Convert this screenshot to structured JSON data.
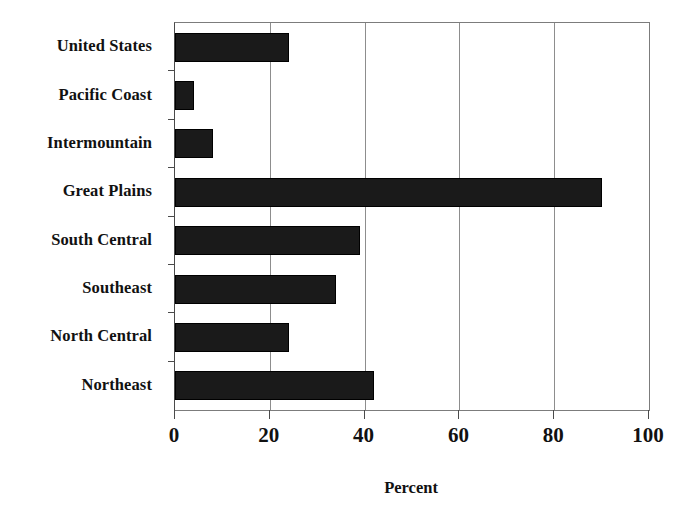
{
  "chart_data": {
    "type": "bar",
    "orientation": "horizontal",
    "title": "",
    "subtitle": "",
    "xlabel": "Percent",
    "ylabel": "",
    "xlim": [
      0,
      100
    ],
    "xticks": [
      0,
      20,
      40,
      60,
      80,
      100
    ],
    "xtick_labels": [
      "0",
      "20",
      "40",
      "60",
      "80",
      "100"
    ],
    "grid": "vertical",
    "legend": "none",
    "bar_color": "#1a1a1a",
    "categories": [
      "United States",
      "Pacific Coast",
      "Intermountain",
      "Great Plains",
      "South Central",
      "Southeast",
      "North Central",
      "Northeast"
    ],
    "values": [
      24,
      4,
      8,
      90,
      39,
      34,
      24,
      42
    ],
    "series": [
      {
        "name": "Percent",
        "values": [
          24,
          4,
          8,
          90,
          39,
          34,
          24,
          42
        ]
      }
    ]
  },
  "axes": {
    "x_axis_title": "Percent"
  }
}
